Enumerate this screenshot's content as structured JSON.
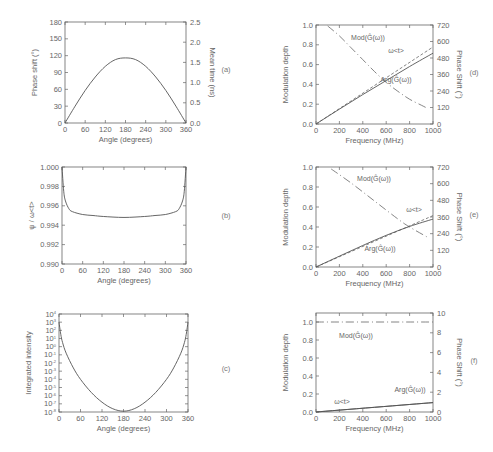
{
  "chart_data": [
    {
      "id": "a",
      "panel_label": "(a)",
      "type": "line",
      "xlabel": "Angle (degrees)",
      "ylabel": "Phase shift (°)",
      "ylabel_right": "Mean time (ns)",
      "xlim": [
        0,
        360
      ],
      "ylim": [
        0,
        180
      ],
      "ylim_right": [
        0,
        2.5
      ],
      "xticks": [
        "0",
        "60",
        "120",
        "180",
        "240",
        "300",
        "360"
      ],
      "yticks": [
        "0",
        "30",
        "60",
        "90",
        "120",
        "150",
        "180"
      ],
      "yticks_right": [
        "0.0",
        "0.5",
        "1.0",
        "1.5",
        "2.0",
        "2.5"
      ],
      "series": [
        {
          "name": "phase shift",
          "x": [
            0,
            30,
            60,
            90,
            120,
            150,
            180,
            210,
            240,
            270,
            300,
            330,
            360
          ],
          "y": [
            0,
            30,
            58,
            82,
            101,
            113,
            116,
            113,
            101,
            82,
            58,
            30,
            0
          ]
        }
      ]
    },
    {
      "id": "b",
      "panel_label": "(b)",
      "type": "line",
      "xlabel": "Angle (degrees)",
      "ylabel": "ψ / ω<t>",
      "xlim": [
        0,
        360
      ],
      "ylim": [
        0.99,
        1.0
      ],
      "xticks": [
        "0",
        "60",
        "120",
        "180",
        "240",
        "300",
        "360"
      ],
      "yticks": [
        "0.990",
        "0.992",
        "0.994",
        "0.996",
        "0.998",
        "1.000"
      ],
      "series": [
        {
          "name": "ratio",
          "x": [
            0,
            5,
            10,
            20,
            30,
            60,
            90,
            120,
            180,
            240,
            270,
            300,
            330,
            340,
            350,
            355,
            360
          ],
          "y": [
            1.0,
            0.9975,
            0.9965,
            0.9957,
            0.9954,
            0.9951,
            0.995,
            0.9949,
            0.9948,
            0.9949,
            0.995,
            0.9951,
            0.9954,
            0.9957,
            0.9965,
            0.9975,
            1.0
          ]
        }
      ]
    },
    {
      "id": "c",
      "panel_label": "(c)",
      "type": "line",
      "xlabel": "Angle (degrees)",
      "ylabel": "Integrated intensity",
      "yscale": "log",
      "xlim": [
        0,
        360
      ],
      "ylim": [
        1e-08,
        10000.0
      ],
      "xticks": [
        "0",
        "60",
        "120",
        "180",
        "240",
        "300",
        "360"
      ],
      "yticks": [
        "10^-8",
        "10^-7",
        "10^-6",
        "10^-5",
        "10^-4",
        "10^-3",
        "10^-2",
        "10^-1",
        "10^0",
        "10^1",
        "10^2",
        "10^3",
        "10^4"
      ],
      "series": [
        {
          "name": "intensity (log10)",
          "x": [
            0,
            5,
            10,
            20,
            40,
            60,
            90,
            120,
            150,
            180,
            210,
            240,
            270,
            300,
            320,
            340,
            350,
            355,
            360
          ],
          "y": [
            3,
            1.5,
            0.5,
            -0.8,
            -2.6,
            -4.0,
            -5.6,
            -6.8,
            -7.6,
            -7.9,
            -7.6,
            -6.8,
            -5.6,
            -4.0,
            -2.6,
            -0.8,
            0.5,
            1.5,
            3
          ]
        }
      ]
    },
    {
      "id": "d",
      "panel_label": "(d)",
      "type": "line",
      "xlabel": "Frequency (MHz)",
      "ylabel": "Modulation depth",
      "ylabel_right": "Phase Shift (°)",
      "xlim": [
        0,
        1000
      ],
      "ylim": [
        0,
        1.0
      ],
      "ylim_right": [
        0,
        720
      ],
      "xticks": [
        "0",
        "200",
        "400",
        "600",
        "800",
        "1000"
      ],
      "yticks": [
        "0.0",
        "0.2",
        "0.4",
        "0.6",
        "0.8",
        "1.0"
      ],
      "yticks_right": [
        "0",
        "120",
        "240",
        "360",
        "480",
        "600",
        "720"
      ],
      "series": [
        {
          "name": "Mod(Ĝ(ω))",
          "style": "dash-dot",
          "axis": "left",
          "x": [
            100,
            200,
            300,
            400,
            500,
            600,
            700,
            800,
            900,
            950
          ],
          "y": [
            0.99,
            0.89,
            0.77,
            0.65,
            0.53,
            0.42,
            0.33,
            0.25,
            0.19,
            0.16
          ]
        },
        {
          "name": "ω<t>",
          "style": "dashed",
          "axis": "right",
          "x": [
            0,
            1000
          ],
          "y": [
            0,
            560
          ]
        },
        {
          "name": "Arg(Ĝ(ω))",
          "style": "solid",
          "axis": "right",
          "x": [
            0,
            200,
            400,
            600,
            800,
            1000
          ],
          "y": [
            0,
            108,
            214,
            316,
            418,
            515
          ]
        }
      ]
    },
    {
      "id": "e",
      "panel_label": "(e)",
      "type": "line",
      "xlabel": "Frequency (MHz)",
      "ylabel": "Modulation depth",
      "ylabel_right": "Phase Shift (°)",
      "xlim": [
        0,
        1000
      ],
      "ylim": [
        0,
        1.0
      ],
      "ylim_right": [
        0,
        720
      ],
      "xticks": [
        "0",
        "200",
        "400",
        "600",
        "800",
        "1000"
      ],
      "yticks": [
        "0.0",
        "0.2",
        "0.4",
        "0.6",
        "0.8",
        "1.0"
      ],
      "yticks_right": [
        "0",
        "120",
        "240",
        "360",
        "480",
        "600",
        "720"
      ],
      "series": [
        {
          "name": "Mod(Ĝ(ω))",
          "style": "dash-dot",
          "axis": "left",
          "x": [
            130,
            300,
            500,
            700,
            800,
            950
          ],
          "y": [
            0.98,
            0.84,
            0.66,
            0.48,
            0.4,
            0.3
          ]
        },
        {
          "name": "ω<t>",
          "style": "dashed",
          "axis": "right",
          "x": [
            0,
            1000
          ],
          "y": [
            0,
            370
          ]
        },
        {
          "name": "Arg(Ĝ(ω))",
          "style": "solid",
          "axis": "right",
          "x": [
            0,
            200,
            400,
            600,
            800,
            1000
          ],
          "y": [
            0,
            78,
            155,
            228,
            292,
            345
          ]
        }
      ]
    },
    {
      "id": "f",
      "panel_label": "(f)",
      "type": "line",
      "xlabel": "Frequency (MHz)",
      "ylabel": "Modulation depth",
      "ylabel_right": "Phase Shift (°)",
      "xlim": [
        0,
        1000
      ],
      "ylim": [
        0,
        1.1
      ],
      "ylim_right": [
        0,
        10
      ],
      "xticks": [
        "0",
        "200",
        "400",
        "600",
        "800",
        "1000"
      ],
      "yticks": [
        "0.0",
        "0.2",
        "0.4",
        "0.6",
        "0.8",
        "1.0"
      ],
      "yticks_right": [
        "0",
        "2",
        "4",
        "6",
        "8",
        "10"
      ],
      "series": [
        {
          "name": "Mod(Ĝ(ω))",
          "style": "dash-dot",
          "axis": "left",
          "x": [
            0,
            1000
          ],
          "y": [
            1.0,
            1.0
          ]
        },
        {
          "name": "ω<t>",
          "style": "solid",
          "axis": "right",
          "x": [
            0,
            1000
          ],
          "y": [
            0,
            0.95
          ]
        },
        {
          "name": "Arg(Ĝ(ω))",
          "style": "solid",
          "axis": "right",
          "x": [
            0,
            1000
          ],
          "y": [
            0,
            0.95
          ]
        }
      ]
    }
  ],
  "annotations": {
    "mod": "Mod(Ĝ(ω))",
    "arg": "Arg(Ĝ(ω))",
    "wt": "ω<t>"
  }
}
